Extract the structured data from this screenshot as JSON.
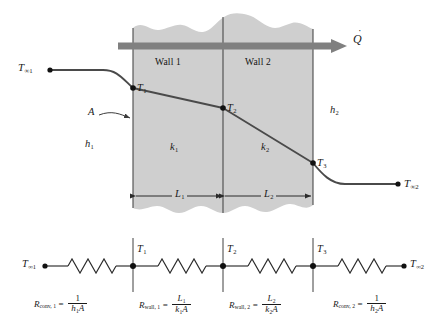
{
  "figure": {
    "colors": {
      "wall_fill": "#cfcfcf",
      "wall_edge": "#4a4a4a",
      "curve": "#4a4a4a",
      "heat_arrow": "#808080",
      "node": "#111111",
      "background": "#ffffff"
    }
  },
  "schematic": {
    "wall1_label": "Wall 1",
    "wall2_label": "Wall 2",
    "heat_flow_symbol": "Q",
    "heat_flow_name": "heat-transfer-rate",
    "area_label": "A",
    "conductivity1": {
      "symbol": "k",
      "sub": "1"
    },
    "conductivity2": {
      "symbol": "k",
      "sub": "2"
    },
    "coefficient1": {
      "symbol": "h",
      "sub": "1"
    },
    "coefficient2": {
      "symbol": "h",
      "sub": "2"
    },
    "thickness1": {
      "symbol": "L",
      "sub": "1"
    },
    "thickness2": {
      "symbol": "L",
      "sub": "2"
    },
    "temps": {
      "tinf1": {
        "symbol": "T",
        "sub": "∞1"
      },
      "t1": {
        "symbol": "T",
        "sub": "1"
      },
      "t2": {
        "symbol": "T",
        "sub": "2"
      },
      "t3": {
        "symbol": "T",
        "sub": "3"
      },
      "tinf2": {
        "symbol": "T",
        "sub": "∞2"
      }
    }
  },
  "network": {
    "nodes": [
      {
        "name": "node-tinf1",
        "symbol": "T",
        "sub": "∞1"
      },
      {
        "name": "node-t1",
        "symbol": "T",
        "sub": "1"
      },
      {
        "name": "node-t2",
        "symbol": "T",
        "sub": "2"
      },
      {
        "name": "node-t3",
        "symbol": "T",
        "sub": "3"
      },
      {
        "name": "node-tinf2",
        "symbol": "T",
        "sub": "∞2"
      }
    ],
    "resistors": [
      {
        "name": "resistor-conv-1",
        "label": "R",
        "label_sub": "conv, 1",
        "equals": "=",
        "numerator": "1",
        "denominator_h": "h",
        "denominator_sub": "1",
        "denominator_a": "A"
      },
      {
        "name": "resistor-wall-1",
        "label": "R",
        "label_sub": "wall, 1",
        "equals": "=",
        "numerator_l": "L",
        "numerator_sub": "1",
        "denominator_k": "k",
        "denominator_sub": "1",
        "denominator_a": "A"
      },
      {
        "name": "resistor-wall-2",
        "label": "R",
        "label_sub": "wall, 2",
        "equals": "=",
        "numerator_l": "L",
        "numerator_sub": "2",
        "denominator_k": "k",
        "denominator_sub": "2",
        "denominator_a": "A"
      },
      {
        "name": "resistor-conv-2",
        "label": "R",
        "label_sub": "conv, 2",
        "equals": "=",
        "numerator": "1",
        "denominator_h": "h",
        "denominator_sub": "2",
        "denominator_a": "A"
      }
    ]
  }
}
